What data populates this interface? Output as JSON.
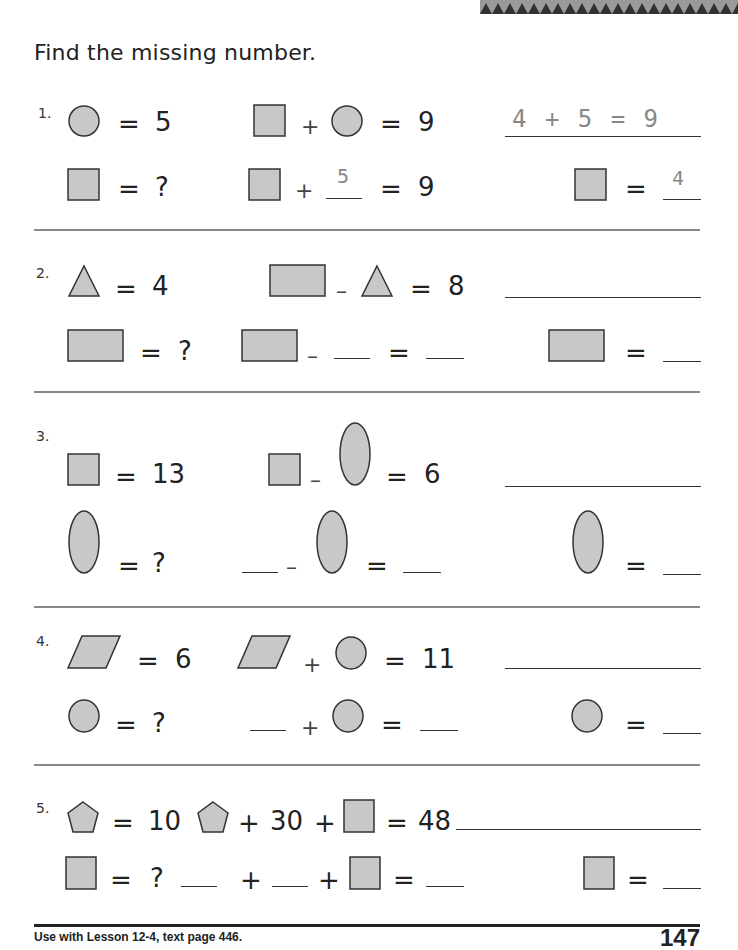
{
  "header": {
    "instruction": "Find the missing number."
  },
  "problems": [
    {
      "number": "1.",
      "given_shape": "circle",
      "given_value": "5",
      "equation": {
        "left": "square",
        "op": "+",
        "right": "circle",
        "result": "9"
      },
      "unknown_shape": "square",
      "unknown_label": "?",
      "work_line": {
        "op": "+",
        "filled": "5",
        "result": "9"
      },
      "answer_sentence": "4 + 5 = 9",
      "answer": "4"
    },
    {
      "number": "2.",
      "given_shape": "triangle",
      "given_value": "4",
      "equation": {
        "left": "rectangle",
        "op": "–",
        "right": "triangle",
        "result": "8"
      },
      "unknown_shape": "rectangle",
      "unknown_label": "?",
      "work_line": {
        "op": "–",
        "eq": "="
      },
      "answer_sentence": "",
      "answer": ""
    },
    {
      "number": "3.",
      "given_shape": "square",
      "given_value": "13",
      "equation": {
        "left": "square",
        "op": "–",
        "right": "oval",
        "result": "6"
      },
      "unknown_shape": "oval",
      "unknown_label": "?",
      "work_line": {
        "op": "–",
        "eq": "="
      },
      "answer_sentence": "",
      "answer": ""
    },
    {
      "number": "4.",
      "given_shape": "parallelogram",
      "given_value": "6",
      "equation": {
        "left": "parallelogram",
        "op": "+",
        "right": "circle",
        "result": "11"
      },
      "unknown_shape": "circle",
      "unknown_label": "?",
      "work_line": {
        "op": "+",
        "eq": "="
      },
      "answer_sentence": "",
      "answer": ""
    },
    {
      "number": "5.",
      "given_shape": "pentagon",
      "given_value": "10",
      "equation": {
        "left": "pentagon",
        "op1": "+",
        "middle": "30",
        "op2": "+",
        "right": "square",
        "result": "48"
      },
      "unknown_shape": "square",
      "unknown_label": "?",
      "work_line": {
        "op1": "+",
        "op2": "+",
        "eq": "="
      },
      "answer_sentence": "",
      "answer": ""
    }
  ],
  "symbols": {
    "eq": "=",
    "plus": "+",
    "minus": "–"
  },
  "colors": {
    "shape_fill": "#c8c8c8",
    "shape_stroke": "#333333",
    "divider": "#888888",
    "traced": "#888888"
  },
  "footer": {
    "lesson_ref": "Use with Lesson 12-4, text page 446.",
    "page_number": "147"
  }
}
